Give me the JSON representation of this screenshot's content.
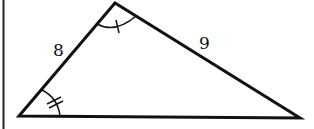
{
  "diagram": {
    "type": "triangle",
    "side_labels": {
      "left_side": "8",
      "right_side": "9"
    },
    "angle_marks": {
      "top_vertex": "single tick arc",
      "bottom_left_vertex": "double tick arc"
    },
    "colors": {
      "stroke": "#111111",
      "background": "#ffffff"
    }
  }
}
